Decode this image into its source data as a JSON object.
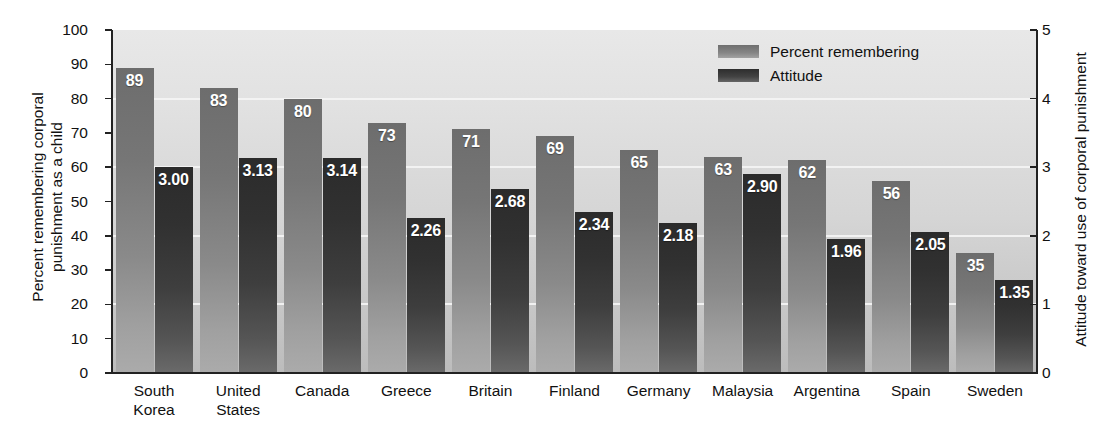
{
  "chart_data": {
    "type": "bar",
    "title": "",
    "subtitle": "",
    "categories": [
      "South\nKorea",
      "United\nStates",
      "Canada",
      "Greece",
      "Britain",
      "Finland",
      "Germany",
      "Malaysia",
      "Argentina",
      "Spain",
      "Sweden"
    ],
    "series": [
      {
        "name": "Percent remembering",
        "axis": "left",
        "values": [
          89,
          83,
          80,
          73,
          71,
          69,
          65,
          63,
          62,
          56,
          35
        ],
        "labels": [
          "89",
          "83",
          "80",
          "73",
          "71",
          "69",
          "65",
          "63",
          "62",
          "56",
          "35"
        ],
        "color": "#7b7b7b"
      },
      {
        "name": "Attitude",
        "axis": "right",
        "values": [
          3.0,
          3.13,
          3.14,
          2.26,
          2.68,
          2.34,
          2.18,
          2.9,
          1.96,
          2.05,
          1.35
        ],
        "labels": [
          "3.00",
          "3.13",
          "3.14",
          "2.26",
          "2.68",
          "2.34",
          "2.18",
          "2.90",
          "1.96",
          "2.05",
          "1.35"
        ],
        "color": "#3a3a3a"
      }
    ],
    "xlabel": "",
    "ylabel": "Percent remembering corporal\npunishment as a child",
    "ylabel_right": "Attitude toward use of corporal punishment",
    "ylim": [
      0,
      100
    ],
    "ylim_right": [
      0,
      5
    ],
    "yticks": [
      0,
      10,
      20,
      30,
      40,
      50,
      60,
      70,
      80,
      90,
      100
    ],
    "yticks_right": [
      0,
      1,
      2,
      3,
      4,
      5
    ],
    "ytick_labels": [
      "0",
      "10",
      "20",
      "30",
      "40",
      "50",
      "60",
      "70",
      "80",
      "90",
      "100"
    ],
    "ytick_labels_right": [
      "0",
      "1",
      "2",
      "3",
      "4",
      "5"
    ],
    "grid": true,
    "grid_axis": "y-right",
    "legend_position": "top-right",
    "legend": [
      "Percent remembering",
      "Attitude"
    ],
    "plot_background": "#d8d8d8",
    "gridline_color": "#f3f3f3"
  }
}
